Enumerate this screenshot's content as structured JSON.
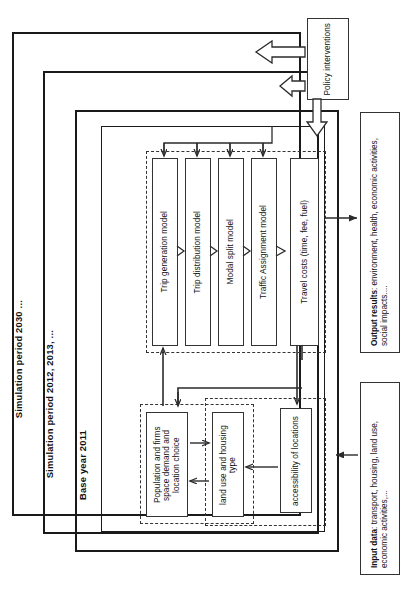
{
  "figure": {
    "orientation": "rotated-90",
    "colors": {
      "ink": "#1a1a1a",
      "line": "#2b2b2b",
      "dashed": "#333333",
      "background": "#ffffff"
    }
  },
  "frames": [
    {
      "id": "sim2030",
      "label": "Simulation period 2030 ..."
    },
    {
      "id": "sim2012",
      "label": "Simulation period 2012, 2013, ..."
    },
    {
      "id": "base2011",
      "label": "Base year 2011"
    }
  ],
  "policy": {
    "label": "Policy interventions"
  },
  "transport_model": {
    "steps": [
      {
        "id": "trip-generation",
        "label": "Trip generation model"
      },
      {
        "id": "trip-distribution",
        "label": "Trip distribution model"
      },
      {
        "id": "modal-split",
        "label": "Modal split model"
      },
      {
        "id": "traffic-assignment",
        "label": "Traffic Assignment model"
      },
      {
        "id": "travel-costs",
        "label": "Travel costs (time, fee, fuel)"
      }
    ]
  },
  "landuse_model": {
    "boxes": [
      {
        "id": "population-firms",
        "label": "Population and firms space demand and location choice"
      },
      {
        "id": "land-use-housing",
        "label": "land use and housing type"
      },
      {
        "id": "accessibility",
        "label": "accessibility of locations"
      }
    ]
  },
  "io": {
    "output": {
      "title": "Output results",
      "separator": ": ",
      "detail": "environment, health, economic activities, social impacts...."
    },
    "input": {
      "title": "Input data",
      "separator": ": ",
      "detail": "transport, housing, land use, economic activities,..."
    }
  }
}
